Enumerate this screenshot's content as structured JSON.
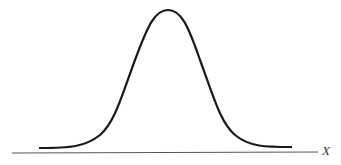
{
  "figure": {
    "axis_label": "X",
    "curve_color": "#1a1a1a",
    "axis_color": "#555555"
  }
}
